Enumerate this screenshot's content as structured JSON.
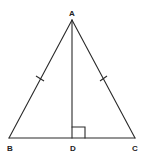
{
  "diagram": {
    "type": "isosceles-triangle-with-altitude",
    "vertices": {
      "A": {
        "label": "A"
      },
      "B": {
        "label": "B"
      },
      "C": {
        "label": "C"
      },
      "D": {
        "label": "D"
      }
    },
    "segments": [
      "AB",
      "AC",
      "BC",
      "AD"
    ],
    "congruent_marks": [
      "AB",
      "AC"
    ],
    "right_angle_at": "D",
    "colors": {
      "stroke": "#2a2a2a",
      "background": "#ffffff"
    }
  }
}
